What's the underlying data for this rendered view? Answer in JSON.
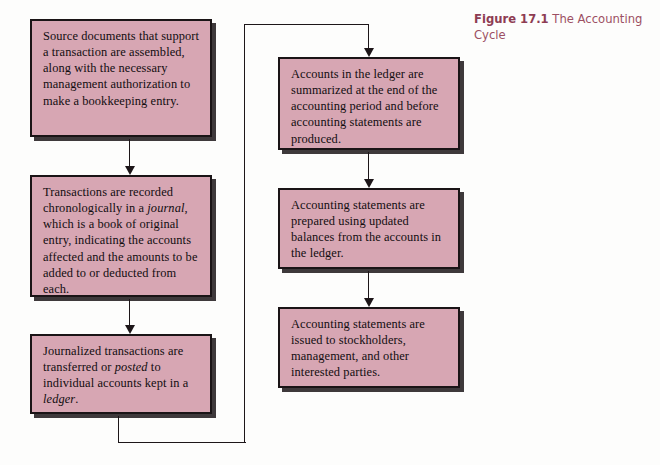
{
  "figure": {
    "caption_label": "Figure 17.1",
    "caption_title": "The Accounting Cycle",
    "caption_color": "#9c4f63"
  },
  "style": {
    "box_fill": "#d7a6b3",
    "box_border": "#1a1416",
    "line_color": "#1d1619",
    "page_background": "#fdfdfc"
  },
  "diagram": {
    "type": "flowchart",
    "orientation": "two-column-serpentine",
    "boxes": [
      {
        "id": "box-1",
        "step": 1,
        "column": "left",
        "text": "Source documents that support a transaction are assembled, along with the necessary management authorization to make a bookkeeping entry.",
        "italic_terms": []
      },
      {
        "id": "box-2",
        "step": 2,
        "column": "left",
        "text": "Transactions are recorded chronologically in a journal, which is a book of original entry, indicating the accounts affected and the amounts to be added to or deducted from each.",
        "italic_terms": [
          "journal"
        ]
      },
      {
        "id": "box-3",
        "step": 3,
        "column": "left",
        "text": "Journalized transactions are transferred or posted to individual accounts kept in a ledger.",
        "italic_terms": [
          "posted",
          "ledger"
        ]
      },
      {
        "id": "box-4",
        "step": 4,
        "column": "right",
        "text": "Accounts in the ledger are summarized at the end of the accounting period and before accounting statements are produced.",
        "italic_terms": []
      },
      {
        "id": "box-5",
        "step": 5,
        "column": "right",
        "text": "Accounting statements are prepared using updated balances from the accounts in the ledger.",
        "italic_terms": []
      },
      {
        "id": "box-6",
        "step": 6,
        "column": "right",
        "text": "Accounting statements are issued to stockholders, management, and other interested parties.",
        "italic_terms": []
      }
    ],
    "connections": [
      {
        "from": "box-1",
        "to": "box-2",
        "style": "straight-down-arrow"
      },
      {
        "from": "box-2",
        "to": "box-3",
        "style": "straight-down-arrow"
      },
      {
        "from": "box-3",
        "to": "box-4",
        "style": "routed-around-bottom-and-top"
      },
      {
        "from": "box-4",
        "to": "box-5",
        "style": "straight-down-arrow"
      },
      {
        "from": "box-5",
        "to": "box-6",
        "style": "straight-down-arrow"
      }
    ]
  }
}
